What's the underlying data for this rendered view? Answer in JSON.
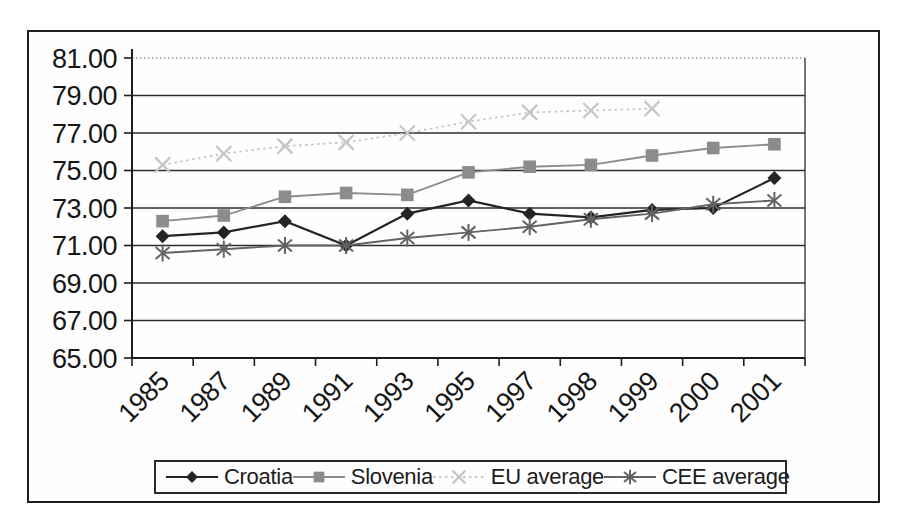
{
  "chart_data": {
    "type": "line",
    "categories": [
      "1985",
      "1987",
      "1989",
      "1991",
      "1993",
      "1995",
      "1997",
      "1998",
      "1999",
      "2000",
      "2001"
    ],
    "series": [
      {
        "name": "Croatia",
        "marker": "diamond",
        "color": "#242424",
        "line_style": "solid",
        "values": [
          71.5,
          71.7,
          72.3,
          71.0,
          72.7,
          73.4,
          72.7,
          72.5,
          72.9,
          73.0,
          74.6
        ]
      },
      {
        "name": "Slovenia",
        "marker": "square",
        "color": "#8c8c8c",
        "line_style": "solid",
        "values": [
          72.3,
          72.6,
          73.6,
          73.8,
          73.7,
          74.9,
          75.2,
          75.3,
          75.8,
          76.2,
          76.4
        ]
      },
      {
        "name": "EU average",
        "marker": "x",
        "color": "#c6c6c6",
        "line_style": "dotted",
        "values": [
          75.3,
          75.9,
          76.3,
          76.5,
          77.0,
          77.6,
          78.1,
          78.2,
          78.3,
          null,
          null
        ]
      },
      {
        "name": "CEE average",
        "marker": "asterisk",
        "color": "#636363",
        "line_style": "solid",
        "values": [
          70.6,
          70.8,
          71.0,
          71.0,
          71.4,
          71.7,
          72.0,
          72.4,
          72.7,
          73.2,
          73.4
        ]
      }
    ],
    "title": "",
    "xlabel": "",
    "ylabel": "",
    "ylim": [
      65,
      81
    ],
    "ytick_labels": [
      "81.00",
      "79.00",
      "77.00",
      "75.00",
      "73.00",
      "71.00",
      "69.00",
      "67.00",
      "65.00"
    ],
    "grid": true,
    "legend_position": "bottom"
  },
  "style": {
    "grid_color": "#2d2d2d",
    "top_gridline_color": "#9a9a9a",
    "axis_color": "#1d1d1d",
    "label_color": "#161616"
  }
}
